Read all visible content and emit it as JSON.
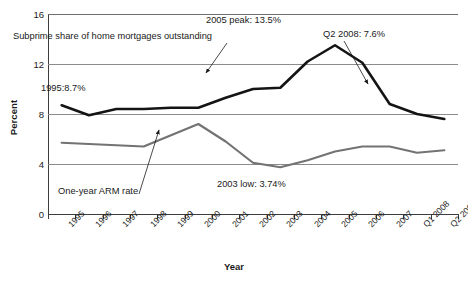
{
  "chart_data": {
    "type": "line",
    "title": "",
    "xlabel": "Year",
    "ylabel": "Percent",
    "ylim": [
      0,
      16
    ],
    "yticks": [
      0,
      4,
      8,
      12,
      16
    ],
    "grid": true,
    "legend": "none (inline labels)",
    "categories": [
      "1995",
      "1996",
      "1997",
      "1998",
      "1999",
      "2000",
      "2001",
      "2002",
      "2003",
      "2004",
      "2005",
      "2006",
      "2007",
      "Q1 2008",
      "Q2 2008"
    ],
    "series": [
      {
        "name": "Subprime share of home mortgages outstanding",
        "color": "#141414",
        "values": [
          8.7,
          7.9,
          8.4,
          8.4,
          8.5,
          8.5,
          9.3,
          10.0,
          10.1,
          12.2,
          13.5,
          12.1,
          8.8,
          8.0,
          7.6
        ]
      },
      {
        "name": "One-year ARM rate",
        "color": "#737373",
        "values": [
          5.7,
          5.6,
          5.5,
          5.4,
          6.3,
          7.2,
          5.8,
          4.1,
          3.74,
          4.3,
          5.0,
          5.4,
          5.4,
          4.9,
          5.1
        ]
      }
    ],
    "annotations": [
      {
        "id": "subprime-label",
        "text": "Subprime share of home mortgages outstanding"
      },
      {
        "id": "peak-label",
        "text": "2005 peak: 13.5%"
      },
      {
        "id": "q2-label",
        "text": "Q2 2008: 7.6%"
      },
      {
        "id": "first-label",
        "text": "1995:8.7%"
      },
      {
        "id": "arm-label",
        "text": "One-year ARM rate"
      },
      {
        "id": "low-label",
        "text": "2003 low: 3.74%"
      }
    ]
  },
  "axes": {
    "y_title": "Percent",
    "x_title": "Year",
    "y_tick_labels": [
      "0",
      "4",
      "8",
      "12",
      "16"
    ],
    "x_tick_labels": [
      "1995",
      "1996",
      "1997",
      "1998",
      "1999",
      "2000",
      "2001",
      "2002",
      "2003",
      "2004",
      "2005",
      "2006",
      "2007",
      "Q1 2008",
      "Q2 2008"
    ]
  },
  "annotations": {
    "subprime_label": "Subprime share of home mortgages outstanding",
    "peak_label": "2005 peak: 13.5%",
    "q2_label": "Q2 2008: 7.6%",
    "first_label": "1995:8.7%",
    "arm_label": "One-year ARM rate",
    "low_label": "2003 low: 3.74%"
  },
  "colors": {
    "subprime_line": "#141414",
    "arm_line": "#737373",
    "grid": "#8b8b8b",
    "axis": "#3d3d3d",
    "text": "#1a1a1a",
    "background": "#ffffff"
  }
}
